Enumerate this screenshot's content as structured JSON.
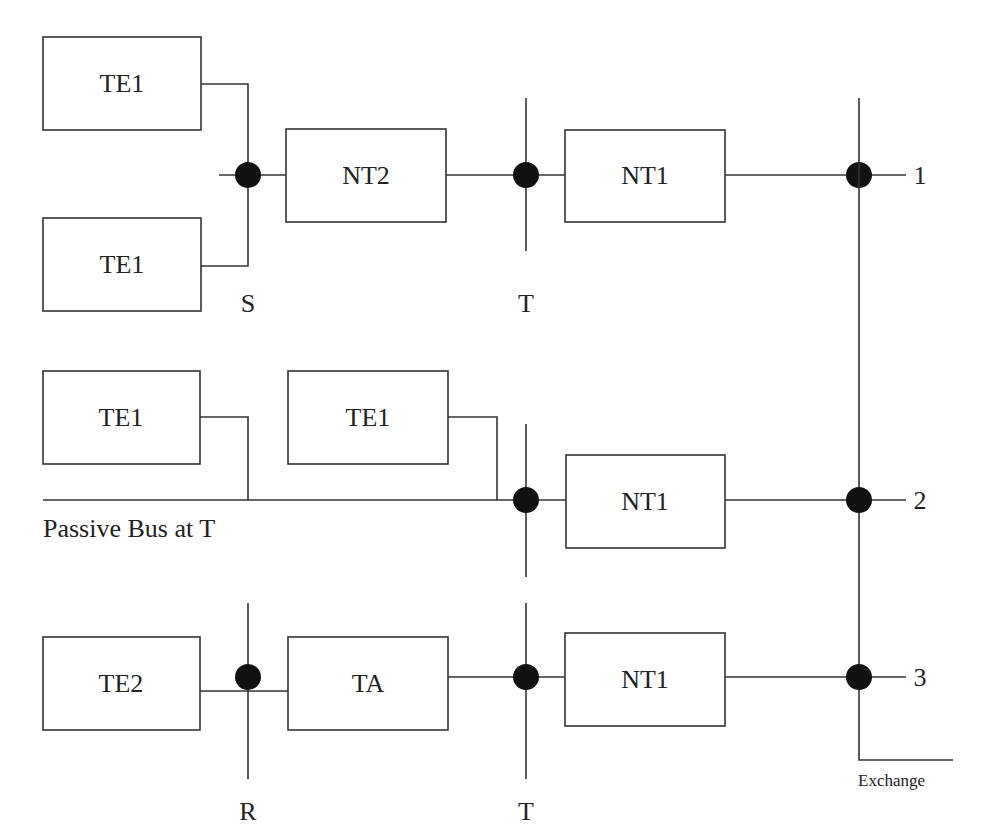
{
  "diagram": {
    "type": "ISDN reference configuration",
    "boxes": {
      "r1_te1_top": "TE1",
      "r1_te1_bottom": "TE1",
      "r1_nt2": "NT2",
      "r1_nt1": "NT1",
      "r2_te1_a": "TE1",
      "r2_te1_b": "TE1",
      "r2_nt1": "NT1",
      "r3_te2": "TE2",
      "r3_ta": "TA",
      "r3_nt1": "NT1"
    },
    "reference_points": {
      "r1_s": "S",
      "r1_t": "T",
      "r3_r": "R",
      "r3_t": "T"
    },
    "line_numbers": [
      "1",
      "2",
      "3"
    ],
    "passive_bus_label": "Passive Bus at T",
    "exchange_label": "Exchange",
    "colors": {
      "line": "#333333",
      "node": "#111111",
      "background": "#ffffff"
    }
  }
}
